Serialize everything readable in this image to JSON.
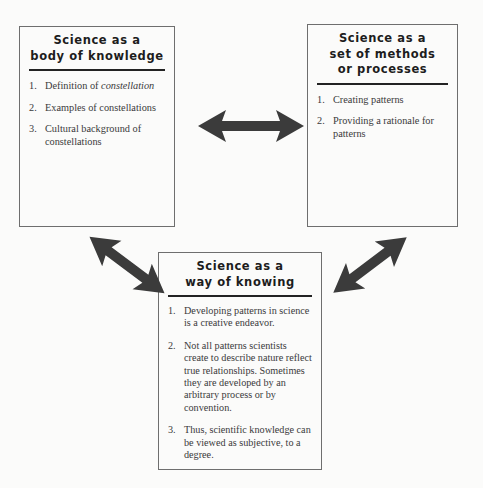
{
  "diagram": {
    "colors": {
      "background": "#fbfbfa",
      "box_border": "#6e6e6e",
      "title_rule": "#232323",
      "arrow": "#3b3b3b",
      "heading_text": "#1d1d1d",
      "body_text": "#3a3a3a"
    },
    "boxes": [
      {
        "id": "knowledge",
        "title_lines": [
          "Science as a",
          "body of knowledge"
        ],
        "items": [
          {
            "number": "1.",
            "text_before": "Definition of ",
            "italic": "constellation",
            "text_after": ""
          },
          {
            "number": "2.",
            "text_before": "Examples of constellations",
            "italic": "",
            "text_after": ""
          },
          {
            "number": "3.",
            "text_before": "Cultural background of constellations",
            "italic": "",
            "text_after": ""
          }
        ]
      },
      {
        "id": "methods",
        "title_lines": [
          "Science as a",
          "set of methods",
          "or processes"
        ],
        "items": [
          {
            "number": "1.",
            "text_before": "Creating patterns",
            "italic": "",
            "text_after": ""
          },
          {
            "number": "2.",
            "text_before": "Providing a rationale for patterns",
            "italic": "",
            "text_after": ""
          }
        ]
      },
      {
        "id": "knowing",
        "title_lines": [
          "Science as a",
          "way of knowing"
        ],
        "items": [
          {
            "number": "1.",
            "text_before": "Developing patterns in science is a creative endeavor.",
            "italic": "",
            "text_after": ""
          },
          {
            "number": "2.",
            "text_before": "Not all patterns scientists create to describe nature reflect true relationships. Sometimes they are developed by an arbitrary process or by convention.",
            "italic": "",
            "text_after": ""
          },
          {
            "number": "3.",
            "text_before": "Thus, scientific knowledge can be viewed as subjective, to a degree.",
            "italic": "",
            "text_after": ""
          }
        ]
      }
    ],
    "arrows": [
      {
        "id": "horizontal",
        "icon": "double-headed-arrow-horizontal-icon",
        "from": "knowledge",
        "to": "methods"
      },
      {
        "id": "left-diagonal",
        "icon": "double-headed-arrow-diagonal-down-right-icon",
        "from": "knowledge",
        "to": "knowing"
      },
      {
        "id": "right-diagonal",
        "icon": "double-headed-arrow-diagonal-down-left-icon",
        "from": "methods",
        "to": "knowing"
      }
    ]
  }
}
